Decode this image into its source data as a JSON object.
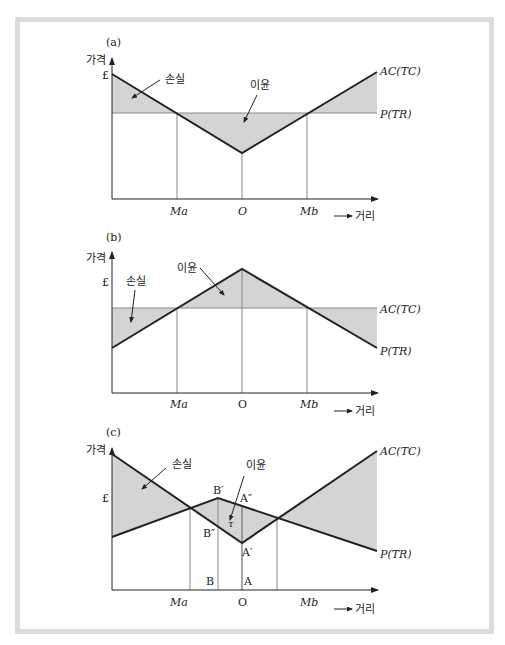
{
  "figure": {
    "panels": [
      {
        "id": "a",
        "label": "(a)",
        "y_axis_label": "가격",
        "y_tick": "£",
        "x_axis_label": "거리",
        "x_ticks": [
          "Ma",
          "O",
          "Mb"
        ],
        "curve_labels": {
          "ac": "AC(TC)",
          "p": "P(TR)"
        },
        "annotations": {
          "loss": "손실",
          "profit": "이윤"
        }
      },
      {
        "id": "b",
        "label": "(b)",
        "y_axis_label": "가격",
        "y_tick": "£",
        "x_axis_label": "거리",
        "x_ticks": [
          "Ma",
          "O",
          "Mb"
        ],
        "curve_labels": {
          "ac": "AC(TC)",
          "p": "P(TR)"
        },
        "annotations": {
          "loss": "손실",
          "profit": "이윤"
        }
      },
      {
        "id": "c",
        "label": "(c)",
        "y_axis_label": "가격",
        "y_tick": "£",
        "x_axis_label": "거리",
        "x_ticks": [
          "Ma",
          "O",
          "Mb"
        ],
        "curve_labels": {
          "ac": "AC(TC)",
          "p": "P(TR)"
        },
        "annotations": {
          "loss": "손실",
          "profit": "이윤",
          "tau": "τ"
        },
        "points": {
          "b_prime": "B′",
          "b_dprime": "B″",
          "a_dprime": "A″",
          "a_prime": "A′",
          "b": "B",
          "a": "A"
        }
      }
    ],
    "colors": {
      "line": "#222222",
      "fill": "#d4d4d4",
      "guide": "#888888",
      "frame": "#dcdcdc"
    }
  }
}
